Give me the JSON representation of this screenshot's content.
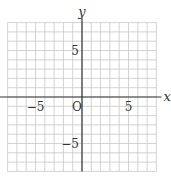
{
  "diagram": {
    "type": "coordinate-grid",
    "axes": {
      "x_label": "x",
      "y_label": "y",
      "origin_label": "O",
      "x_range": [
        -8,
        8
      ],
      "y_range": [
        -8,
        8
      ],
      "grid_step": 1
    },
    "tick_labels": {
      "x": [
        {
          "value": -5,
          "text": "−5"
        },
        {
          "value": 5,
          "text": "5"
        }
      ],
      "y": [
        {
          "value": 5,
          "text": "5"
        },
        {
          "value": -5,
          "text": "−5"
        }
      ]
    },
    "colors": {
      "grid": "#c8c8c8",
      "axis": "#333333",
      "background": "#ffffff"
    }
  }
}
